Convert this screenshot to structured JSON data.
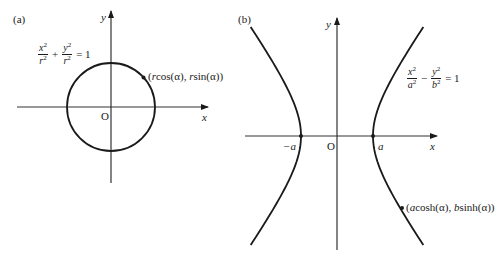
{
  "panels": {
    "a": {
      "tag": "(a)",
      "y_label": "y",
      "x_label": "x",
      "origin_label": "O",
      "equation": {
        "term1_num": "x",
        "term1_den": "r",
        "op": "+",
        "term2_num": "y",
        "term2_den": "r",
        "exp": "2",
        "rhs": "= 1"
      },
      "point_label": "(rcos(α), rsin(α))",
      "point_label_parts": [
        "(",
        "r",
        "cos(α), ",
        "r",
        "sin(α))"
      ]
    },
    "b": {
      "tag": "(b)",
      "y_label": "y",
      "x_label": "x",
      "origin_label": "O",
      "neg_vertex_label": "−a",
      "pos_vertex_label": "a",
      "equation": {
        "term1_num": "x",
        "term1_den": "a",
        "op": "−",
        "term2_num": "y",
        "term2_den": "b",
        "exp": "2",
        "rhs": "= 1"
      },
      "point_label": "(acosh(α), bsinh(α))",
      "point_label_parts": [
        "(",
        "a",
        "cosh(α), ",
        "b",
        "sinh(α))"
      ]
    }
  },
  "colors": {
    "stroke": "#1a1a1a",
    "axis": "#333333",
    "background": "#ffffff"
  }
}
